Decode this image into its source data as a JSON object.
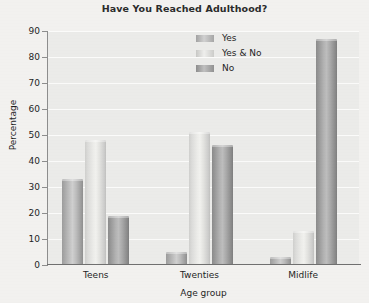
{
  "chart_data": {
    "type": "bar",
    "title": "Have You Reached Adulthood?",
    "xlabel": "Age group",
    "ylabel": "Percentage",
    "categories": [
      "Teens",
      "Twenties",
      "Midlife"
    ],
    "series": [
      {
        "name": "Yes",
        "values": [
          33,
          5,
          3
        ],
        "color": "#bdbdbd"
      },
      {
        "name": "Yes & No",
        "values": [
          48,
          51,
          13
        ],
        "color": "#e8e8e5"
      },
      {
        "name": "No",
        "values": [
          19,
          46,
          87
        ],
        "color": "#a5a5a5"
      }
    ],
    "ylim": [
      0,
      90
    ],
    "yticks": [
      0,
      10,
      20,
      30,
      40,
      50,
      60,
      70,
      80,
      90
    ],
    "ytick_labels": [
      "0",
      "10",
      "20",
      "30",
      "40",
      "50",
      "60",
      "70",
      "80",
      "90"
    ],
    "grid": true,
    "grid_color": "#fbfbfa",
    "legend_position": "top-center-right",
    "plot_background": "#ebebe9",
    "figure_background": "#f2f1ef"
  }
}
